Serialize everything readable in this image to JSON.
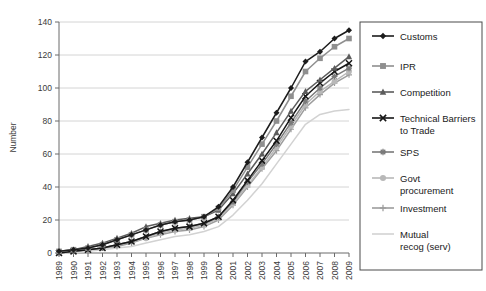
{
  "chart_data": {
    "type": "line",
    "title": "",
    "xlabel": "",
    "ylabel": "Number",
    "ylim": [
      0,
      140
    ],
    "ytick_step": 20,
    "yticks": [
      0,
      20,
      40,
      60,
      80,
      100,
      120,
      140
    ],
    "grid": true,
    "legend_position": "right",
    "categories": [
      "1989",
      "1990",
      "1991",
      "1992",
      "1993",
      "1994",
      "1995",
      "1996",
      "1997",
      "1998",
      "1999",
      "2000",
      "2001",
      "2002",
      "2003",
      "2004",
      "2005",
      "2006",
      "2007",
      "2008",
      "2009"
    ],
    "x": [
      1989,
      1990,
      1991,
      1992,
      1993,
      1994,
      1995,
      1996,
      1997,
      1998,
      1999,
      2000,
      2001,
      2002,
      2003,
      2004,
      2005,
      2006,
      2007,
      2008,
      2009
    ],
    "series": [
      {
        "name": "Customs",
        "marker": "diamond",
        "color": "#1c1c1c",
        "values": [
          1,
          2,
          3,
          5,
          8,
          11,
          14,
          17,
          19,
          20,
          22,
          28,
          40,
          55,
          70,
          85,
          100,
          116,
          122,
          130,
          135
        ]
      },
      {
        "name": "IPR",
        "marker": "square",
        "color": "#8f8f8f",
        "values": [
          1,
          2,
          3,
          5,
          8,
          11,
          14,
          17,
          19,
          20,
          22,
          27,
          38,
          52,
          66,
          80,
          95,
          110,
          118,
          125,
          130
        ]
      },
      {
        "name": "Competition",
        "marker": "triangle",
        "color": "#5c5c5c",
        "values": [
          1,
          2,
          4,
          6,
          9,
          12,
          16,
          18,
          20,
          21,
          22,
          26,
          36,
          48,
          60,
          73,
          86,
          98,
          105,
          112,
          119
        ]
      },
      {
        "name": "Technical Barriers to Trade",
        "marker": "cross",
        "color": "#161616",
        "values": [
          0,
          1,
          2,
          3,
          5,
          7,
          10,
          13,
          15,
          16,
          18,
          22,
          32,
          44,
          56,
          68,
          82,
          95,
          103,
          110,
          115
        ]
      },
      {
        "name": "SPS",
        "marker": "asterisk",
        "color": "#7a7a7a",
        "values": [
          0,
          1,
          2,
          3,
          5,
          7,
          10,
          13,
          15,
          16,
          18,
          22,
          31,
          43,
          54,
          66,
          79,
          92,
          100,
          107,
          112
        ]
      },
      {
        "name": "Govt procurement",
        "marker": "circle",
        "color": "#b8b8b8",
        "values": [
          0,
          1,
          2,
          3,
          5,
          7,
          9,
          12,
          14,
          15,
          17,
          21,
          30,
          41,
          52,
          64,
          77,
          90,
          98,
          104,
          110
        ]
      },
      {
        "name": "Investment",
        "marker": "plus",
        "color": "#9d9d9d",
        "values": [
          0,
          1,
          2,
          3,
          4,
          6,
          9,
          11,
          13,
          14,
          16,
          20,
          29,
          40,
          51,
          62,
          75,
          88,
          96,
          103,
          108
        ]
      },
      {
        "name": "Mutual recog (serv)",
        "marker": "none",
        "color": "#d2d2d2",
        "values": [
          0,
          0,
          1,
          2,
          3,
          4,
          6,
          8,
          10,
          11,
          13,
          16,
          23,
          32,
          42,
          54,
          66,
          78,
          84,
          86,
          87
        ]
      }
    ]
  },
  "axis": {
    "y_title": "Number",
    "y_tick_labels": [
      "0",
      "20",
      "40",
      "60",
      "80",
      "100",
      "120",
      "140"
    ],
    "x_tick_labels": [
      "1989",
      "1990",
      "1991",
      "1992",
      "1993",
      "1994",
      "1995",
      "1996",
      "1997",
      "1998",
      "1999",
      "2000",
      "2001",
      "2002",
      "2003",
      "2004",
      "2005",
      "2006",
      "2007",
      "2008",
      "2009"
    ]
  },
  "legend": {
    "entries": [
      {
        "label": "Customs"
      },
      {
        "label": "IPR"
      },
      {
        "label": "Competition"
      },
      {
        "label": "Technical Barriers to Trade"
      },
      {
        "label": "SPS"
      },
      {
        "label": "Govt procurement"
      },
      {
        "label": "Investment"
      },
      {
        "label": "Mutual recog (serv)"
      }
    ]
  }
}
